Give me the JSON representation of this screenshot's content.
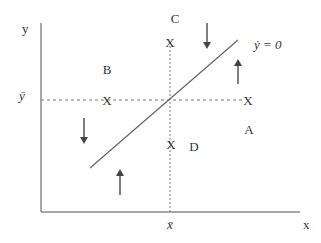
{
  "diagram": {
    "axes": {
      "y_label": "y",
      "x_label": "x",
      "y_bar_label": "ȳ",
      "x_bar_label": "x̄"
    },
    "regions": {
      "A": "A",
      "B": "B",
      "C": "C",
      "D": "D"
    },
    "curve_label": "ẏ = 0",
    "markers": [
      "X",
      "X",
      "X",
      "X"
    ],
    "colors": {
      "axis": "#808080",
      "line": "#666666",
      "arrow": "#555555",
      "text": "#333333"
    }
  }
}
